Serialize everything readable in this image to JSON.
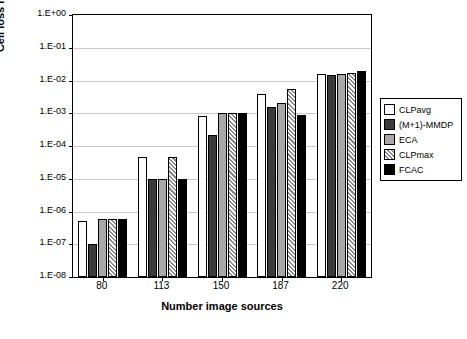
{
  "chart_data": {
    "type": "bar",
    "title": "",
    "xlabel": "Number image sources",
    "ylabel": "Cell loss ratio",
    "categories": [
      "80",
      "113",
      "150",
      "187",
      "220"
    ],
    "ytick_labels": [
      "1.E+00",
      "1.E-01",
      "1.E-02",
      "1.E-03",
      "1.E-04",
      "1.E-05",
      "1.E-06",
      "1.E-07",
      "1.E-08"
    ],
    "ylim": [
      1e-08,
      1
    ],
    "log_scale": true,
    "grid": true,
    "legend_position": "right",
    "series": [
      {
        "name": "CLPavg",
        "color": "#ffffff",
        "values": [
          5e-07,
          4.5e-05,
          0.0008,
          0.004,
          0.016
        ]
      },
      {
        "name": "(M+1)-MMDP",
        "color": "#3a3a3a",
        "values": [
          1e-07,
          1e-05,
          0.00022,
          0.0015,
          0.015
        ]
      },
      {
        "name": "ECA",
        "color": "#a8a8a8",
        "values": [
          6e-07,
          1e-05,
          0.001,
          0.002,
          0.016
        ]
      },
      {
        "name": "CLPmax",
        "color": "#b8b8b8",
        "values": [
          6e-07,
          4.5e-05,
          0.001,
          0.0055,
          0.017
        ]
      },
      {
        "name": "FCAC",
        "color": "#000000",
        "values": [
          6e-07,
          1e-05,
          0.001,
          0.0009,
          0.02
        ]
      }
    ]
  },
  "legend": {
    "items": [
      {
        "label": "CLPavg"
      },
      {
        "label": "(M+1)-MMDP"
      },
      {
        "label": "ECA"
      },
      {
        "label": "CLPmax"
      },
      {
        "label": "FCAC"
      }
    ]
  }
}
